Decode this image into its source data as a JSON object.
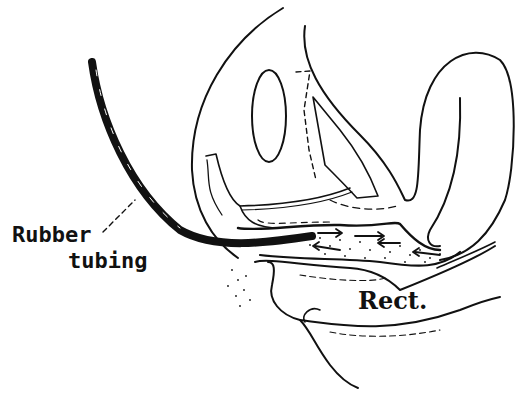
{
  "figure": {
    "type": "anatomical line drawing",
    "labels": {
      "rubber_tubing_line1": "Rubber",
      "rubber_tubing_line2": "tubing",
      "rectum": "Rect."
    },
    "colors": {
      "ink": "#111111",
      "background": "#ffffff"
    }
  }
}
